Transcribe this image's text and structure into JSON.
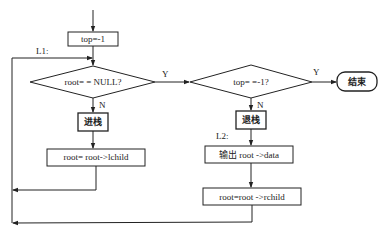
{
  "diagram": {
    "type": "flowchart",
    "nodes": {
      "init": {
        "text": "top=-1",
        "shape": "rect"
      },
      "cond1": {
        "text": "root= = NULL?",
        "shape": "diamond"
      },
      "push": {
        "text": "进栈",
        "shape": "rect"
      },
      "left": {
        "text": "root= root->lchild",
        "shape": "rect"
      },
      "cond2": {
        "text": "top= =-1?",
        "shape": "diamond"
      },
      "end": {
        "text": "结束",
        "shape": "terminal"
      },
      "pop": {
        "text": "退栈",
        "shape": "rect"
      },
      "output": {
        "text": "输出 root ->data",
        "shape": "rect"
      },
      "right": {
        "text": "root=root ->rchild",
        "shape": "rect"
      }
    },
    "labels": {
      "l1": "L1:",
      "l2": "L2:",
      "cond1_yes": "Y",
      "cond1_no": "N",
      "cond2_yes": "Y",
      "cond2_no": "N"
    },
    "edges": [
      {
        "from": "start",
        "to": "init"
      },
      {
        "from": "init",
        "to": "cond1"
      },
      {
        "from": "cond1",
        "to": "cond2",
        "label": "Y"
      },
      {
        "from": "cond1",
        "to": "push",
        "label": "N"
      },
      {
        "from": "push",
        "to": "left"
      },
      {
        "from": "left",
        "to": "cond1",
        "via": "loop-L1"
      },
      {
        "from": "cond2",
        "to": "end",
        "label": "Y"
      },
      {
        "from": "cond2",
        "to": "pop",
        "label": "N"
      },
      {
        "from": "pop",
        "to": "output"
      },
      {
        "from": "output",
        "to": "right"
      },
      {
        "from": "right",
        "to": "cond1",
        "via": "loop-L1"
      }
    ],
    "colors": {
      "stroke": "#222222",
      "background": "#ffffff"
    }
  }
}
